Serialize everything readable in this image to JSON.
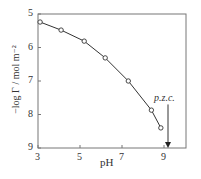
{
  "chart_data": {
    "type": "scatter",
    "title": "",
    "xlabel": "pH",
    "ylabel": "−log Γ / mol m⁻²",
    "xlim": [
      3,
      9.5
    ],
    "ylim": [
      5,
      9
    ],
    "y_inverted": true,
    "x_ticks": [
      "3",
      "5",
      "7",
      "9"
    ],
    "y_ticks": [
      "5",
      "6",
      "7",
      "8",
      "9"
    ],
    "grid": false,
    "series": [
      {
        "name": "data",
        "marker": "open-circle",
        "x": [
          3.1,
          4.1,
          5.2,
          6.2,
          7.3,
          8.4,
          8.85
        ],
        "y": [
          5.24,
          5.48,
          5.81,
          6.31,
          7.0,
          7.87,
          8.4
        ]
      }
    ],
    "fit_curve": true,
    "annotations": [
      {
        "text": "p.z.c.",
        "x": 9.0,
        "arrow_to_y": 9,
        "arrow_from_y": 7.7
      }
    ]
  }
}
